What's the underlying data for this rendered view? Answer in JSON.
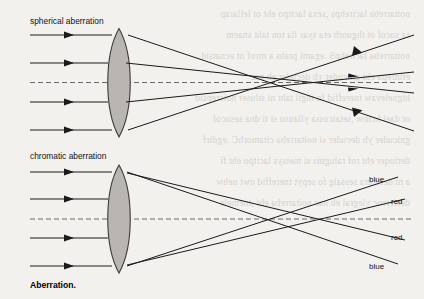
{
  "figure": {
    "caption": "Aberration.",
    "panels": [
      {
        "id": "spherical",
        "title": "spherical aberration",
        "lens": {
          "fill": "#b9b6b1",
          "stroke": "#3a3a3a"
        },
        "axis_style": "dashed",
        "ray_count": 4,
        "focus_description": "outer rays focus nearer the lens than inner rays"
      },
      {
        "id": "chromatic",
        "title": "chromatic aberration",
        "lens": {
          "fill": "#b9b6b1",
          "stroke": "#3a3a3a"
        },
        "axis_style": "dashed",
        "ray_count": 4,
        "ray_labels": [
          "blue",
          "red",
          "red",
          "blue"
        ],
        "focus_description": "blue focuses nearer the lens than red"
      }
    ]
  },
  "labels": {
    "spherical": "spherical aberration",
    "chromatic": "chromatic aberration",
    "blue_top": "blue",
    "red_top": "red",
    "red_bottom": "red",
    "blue_bottom": "blue"
  },
  "colors": {
    "page_background": "#f3f1ee",
    "ink": "#1a1a1a",
    "lens_fill": "#b9b6b1",
    "lens_stroke": "#3a3a3a",
    "axis": "#6b6b6b"
  },
  "bleed_through": {
    "note": "faint mirrored show-through text from the reverse side of the scanned page",
    "lines": [
      "noitarreba lacirehps ,sexa lacitpo eht ot lellarap",
      "sa sucof ot thguorb era syar lla ton taht snaem",
      "noitarreba lacirehpS .egami prahs a mrof ot ecnatsid",
      "erutrepa eht gnicuder yb decuder eb nac",
      "htgnelevaw tnereffid fo thgil taht ni stluser noisrepsid",
      "ot dael hcihw ,setaicossa yllausu si ti dna sesucof",
      "gnicuder yb decuder si noitarreba citamorhC .egdirf",
      "deriuqer eht rof ralugnis si metsys lacitpo eht fi",
      "a ni desu era sessalg fo sepyt tnereffid owt nehw",
      "detcerroc ylegral eb nac noitarreba eht ,tnemele"
    ]
  }
}
